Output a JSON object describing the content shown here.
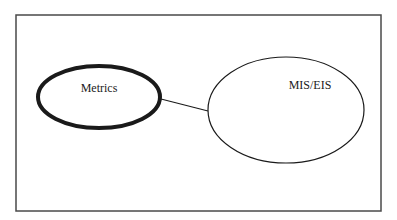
{
  "diagram": {
    "frame": {
      "x": 16,
      "y": 15,
      "w": 365,
      "h": 196,
      "stroke": "#4a4a4a"
    },
    "nodes": [
      {
        "id": "metrics",
        "label": "Metrics",
        "cx": 99,
        "cy": 97,
        "rx": 61,
        "ry": 31,
        "stroke_width": 4,
        "label_x": 99,
        "label_y": 92
      },
      {
        "id": "mis_eis",
        "label": "MIS/EIS",
        "cx": 286,
        "cy": 110,
        "rx": 78,
        "ry": 53,
        "stroke_width": 1.2,
        "label_x": 310,
        "label_y": 89
      }
    ],
    "edges": [
      {
        "from": "metrics",
        "to": "mis_eis",
        "x1": 161,
        "y1": 99,
        "x2": 208,
        "y2": 111
      }
    ]
  }
}
